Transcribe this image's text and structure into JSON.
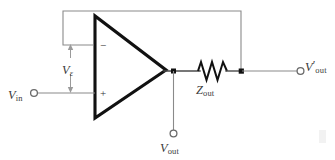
{
  "figure": {
    "kind": "circuit-diagram",
    "background_color": "#ffffff",
    "wire_color": "#4a4a4a",
    "component_color": "#111111"
  },
  "labels": {
    "v_in": {
      "symbol": "V",
      "subscript": "in",
      "full": "V_in"
    },
    "v_epsilon": {
      "symbol": "V",
      "subscript": "ε",
      "full": "V_ε"
    },
    "z_out": {
      "symbol": "Z",
      "subscript": "out",
      "full": "Z_out"
    },
    "v_out": {
      "symbol": "V",
      "subscript": "out",
      "full": "V_out"
    },
    "v_out_prime": {
      "symbol": "V",
      "prime": "′",
      "subscript": "out",
      "full": "V'_out"
    }
  },
  "opamp": {
    "inverting_input_sign": "−",
    "noninverting_input_sign": "+",
    "shape": "triangle",
    "orientation": "points-right"
  },
  "terminals": [
    {
      "name": "input-terminal",
      "label": "V_in",
      "position": "left"
    },
    {
      "name": "output-terminal-internal",
      "label": "V_out",
      "position": "bottom-center"
    },
    {
      "name": "output-terminal-external",
      "label": "V'_out",
      "position": "right"
    }
  ],
  "nodes": [
    {
      "name": "opamp-output-node",
      "label": "V_out"
    },
    {
      "name": "load-node",
      "label": "V'_out"
    }
  ],
  "components": [
    {
      "name": "operational-amplifier",
      "type": "opamp"
    },
    {
      "name": "output-impedance",
      "type": "resistor",
      "label": "Z_out"
    },
    {
      "name": "feedback-wire",
      "type": "wire"
    }
  ],
  "annotations": [
    {
      "name": "differential-voltage-arrow",
      "label": "V_ε",
      "style": "double-headed-vertical-arrow"
    }
  ]
}
